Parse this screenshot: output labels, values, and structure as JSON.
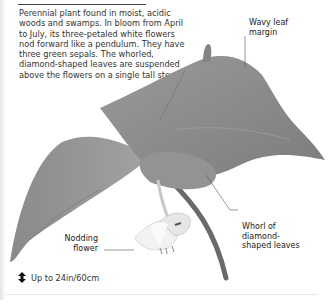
{
  "article": {
    "title": "NODDING TRILLIUM",
    "description": "Perennial plant found in moist, acidic woods and swamps. In bloom from April to July, its three-petaled white flowers nod forward like a pendulum. They have three green sepals. The whorled, diamond-shaped leaves are suspended above the flowers on a single tall stem."
  },
  "callouts": {
    "wavy_leaf_margin": [
      "Wavy leaf",
      "margin"
    ],
    "whorl": [
      "Whorl of",
      "diamond-",
      "shaped leaves"
    ],
    "nodding_flower": [
      "Nodding",
      "flower"
    ]
  },
  "height": {
    "icon": "up-down-arrow-icon",
    "label": "Up to 24in/60cm"
  },
  "colors": {
    "leaf": "#8f8f8f",
    "leaf_dark": "#6e6e6e",
    "leaf_light": "#a9a9a9",
    "stem": "#6a6a6a",
    "flower": "#f0f0f0",
    "text": "#2a2a2a"
  }
}
